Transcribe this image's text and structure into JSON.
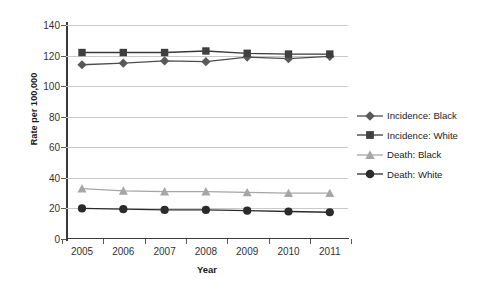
{
  "chart_data": {
    "type": "line",
    "title": "",
    "xlabel": "Year",
    "ylabel": "Rate per 100,000",
    "x": [
      2005,
      2006,
      2007,
      2008,
      2009,
      2010,
      2011
    ],
    "xtick_labels": [
      "2005",
      "2006",
      "2007",
      "2008",
      "2009",
      "2010",
      "2011"
    ],
    "ytick_labels": [
      "0",
      "20",
      "40",
      "60",
      "80",
      "100",
      "120",
      "140"
    ],
    "yticks": [
      0,
      20,
      40,
      60,
      80,
      100,
      120,
      140
    ],
    "ylim": [
      0,
      140
    ],
    "grid": "horizontal",
    "legend_position": "right",
    "series": [
      {
        "name": "Incidence: Black",
        "marker": "diamond",
        "color": "#595959",
        "line_color": "#4d4d4d",
        "values": [
          114.0,
          115.0,
          116.5,
          116.0,
          119.0,
          118.0,
          119.5
        ]
      },
      {
        "name": "Incidence: White",
        "marker": "square",
        "color": "#3f3f3f",
        "line_color": "#3a3a3a",
        "values": [
          122.0,
          122.0,
          122.0,
          123.0,
          121.5,
          121.0,
          121.0
        ]
      },
      {
        "name": "Death: Black",
        "marker": "triangle",
        "color": "#a6a6a6",
        "line_color": "#a6a6a6",
        "values": [
          33.0,
          31.5,
          31.0,
          31.0,
          30.5,
          30.0,
          30.0
        ]
      },
      {
        "name": "Death: White",
        "marker": "circle",
        "color": "#2b2b2b",
        "line_color": "#2b2b2b",
        "values": [
          20.0,
          19.5,
          19.0,
          19.0,
          18.5,
          18.0,
          17.5
        ]
      }
    ]
  },
  "legend": {
    "items": [
      {
        "label": "Incidence: Black"
      },
      {
        "label": "Incidence: White"
      },
      {
        "label": "Death: Black"
      },
      {
        "label": "Death: White"
      }
    ]
  },
  "axes": {
    "y_title": "Rate per 100,000",
    "x_title": "Year"
  },
  "colors": {
    "gridline": "#c9c9c9",
    "axis": "#3a3a3a",
    "background": "#ffffff",
    "text": "#333333"
  }
}
